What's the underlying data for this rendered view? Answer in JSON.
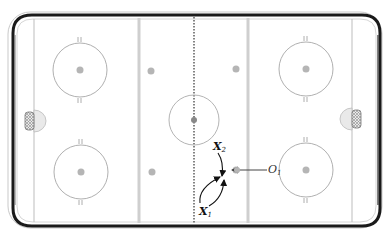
{
  "diagram": {
    "type": "hockey-rink-drill",
    "colors": {
      "boards": "#1a1a1a",
      "board_highlight": "#bdbdbd",
      "ice": "#ffffff",
      "lines": "#c8c8c8",
      "circles": "#a9a9a9",
      "dots": "#b3b3b3",
      "crease": "#e6e6e6",
      "net": "#9a9a9a",
      "arrows": "#111111",
      "pass_arrow": "#444444"
    },
    "players": [
      {
        "id": "x2",
        "letter": "X",
        "number": "2",
        "team": "offense"
      },
      {
        "id": "x1",
        "letter": "X",
        "number": "1",
        "team": "offense"
      },
      {
        "id": "o1",
        "letter": "O",
        "number": "1",
        "team": "defense"
      }
    ],
    "labels": {
      "x2": {
        "letter": "X",
        "num": "2"
      },
      "x1": {
        "letter": "X",
        "num": "1"
      },
      "o1": {
        "letter": "O",
        "num": "1"
      }
    }
  }
}
